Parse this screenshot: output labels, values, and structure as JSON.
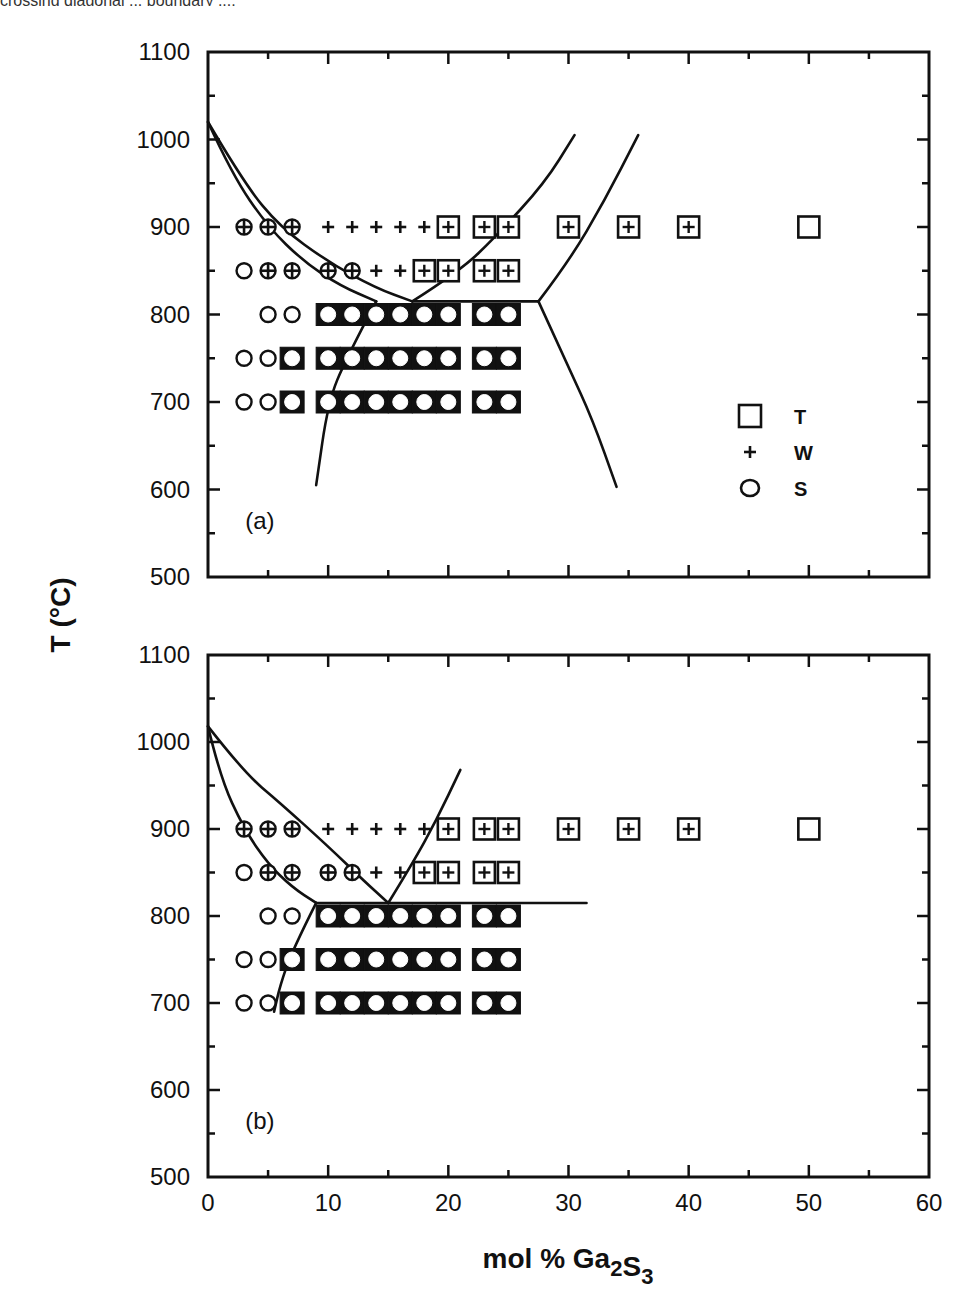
{
  "figure": {
    "top_caption_fragment": "crossing diagonal ... boundary ...;"
  },
  "chart_data": [
    {
      "type": "scatter",
      "panel_label": "(a)",
      "title": "",
      "xlabel": "mol % Ga2S3",
      "ylabel": "T (°C)",
      "xlim": [
        0,
        60
      ],
      "ylim": [
        500,
        1100
      ],
      "xticks": [
        0,
        10,
        20,
        30,
        40,
        50,
        60
      ],
      "yticks": [
        500,
        600,
        700,
        800,
        900,
        1000,
        1100
      ],
      "grid": false,
      "legend": {
        "position": "lower right",
        "entries": [
          {
            "marker": "square",
            "label": "T"
          },
          {
            "marker": "plus",
            "label": "W"
          },
          {
            "marker": "circle",
            "label": "S"
          }
        ]
      },
      "points": [
        {
          "x": 3,
          "y": 900,
          "phases": [
            "W",
            "S"
          ]
        },
        {
          "x": 5,
          "y": 900,
          "phases": [
            "W",
            "S"
          ]
        },
        {
          "x": 7,
          "y": 900,
          "phases": [
            "W",
            "S"
          ]
        },
        {
          "x": 10,
          "y": 900,
          "phases": [
            "W"
          ]
        },
        {
          "x": 12,
          "y": 900,
          "phases": [
            "W"
          ]
        },
        {
          "x": 14,
          "y": 900,
          "phases": [
            "W"
          ]
        },
        {
          "x": 16,
          "y": 900,
          "phases": [
            "W"
          ]
        },
        {
          "x": 18,
          "y": 900,
          "phases": [
            "W"
          ]
        },
        {
          "x": 20,
          "y": 900,
          "phases": [
            "T",
            "W"
          ]
        },
        {
          "x": 23,
          "y": 900,
          "phases": [
            "T",
            "W"
          ]
        },
        {
          "x": 25,
          "y": 900,
          "phases": [
            "T",
            "W"
          ]
        },
        {
          "x": 30,
          "y": 900,
          "phases": [
            "T",
            "W"
          ]
        },
        {
          "x": 35,
          "y": 900,
          "phases": [
            "T",
            "W"
          ]
        },
        {
          "x": 40,
          "y": 900,
          "phases": [
            "T",
            "W"
          ]
        },
        {
          "x": 50,
          "y": 900,
          "phases": [
            "T"
          ]
        },
        {
          "x": 3,
          "y": 850,
          "phases": [
            "S"
          ]
        },
        {
          "x": 5,
          "y": 850,
          "phases": [
            "W",
            "S"
          ]
        },
        {
          "x": 7,
          "y": 850,
          "phases": [
            "W",
            "S"
          ]
        },
        {
          "x": 10,
          "y": 850,
          "phases": [
            "W",
            "S"
          ]
        },
        {
          "x": 12,
          "y": 850,
          "phases": [
            "W",
            "S"
          ]
        },
        {
          "x": 14,
          "y": 850,
          "phases": [
            "W"
          ]
        },
        {
          "x": 16,
          "y": 850,
          "phases": [
            "W"
          ]
        },
        {
          "x": 18,
          "y": 850,
          "phases": [
            "T",
            "W"
          ]
        },
        {
          "x": 20,
          "y": 850,
          "phases": [
            "T",
            "W"
          ]
        },
        {
          "x": 23,
          "y": 850,
          "phases": [
            "T",
            "W"
          ]
        },
        {
          "x": 25,
          "y": 850,
          "phases": [
            "T",
            "W"
          ]
        },
        {
          "x": 5,
          "y": 800,
          "phases": [
            "S"
          ]
        },
        {
          "x": 7,
          "y": 800,
          "phases": [
            "S"
          ]
        },
        {
          "x": 10,
          "y": 800,
          "phases": [
            "T",
            "S"
          ]
        },
        {
          "x": 12,
          "y": 800,
          "phases": [
            "T",
            "S"
          ]
        },
        {
          "x": 14,
          "y": 800,
          "phases": [
            "T",
            "S"
          ]
        },
        {
          "x": 16,
          "y": 800,
          "phases": [
            "T",
            "S"
          ]
        },
        {
          "x": 18,
          "y": 800,
          "phases": [
            "T",
            "S"
          ]
        },
        {
          "x": 20,
          "y": 800,
          "phases": [
            "T",
            "S"
          ]
        },
        {
          "x": 23,
          "y": 800,
          "phases": [
            "T",
            "S"
          ]
        },
        {
          "x": 25,
          "y": 800,
          "phases": [
            "T",
            "S"
          ]
        },
        {
          "x": 3,
          "y": 750,
          "phases": [
            "S"
          ]
        },
        {
          "x": 5,
          "y": 750,
          "phases": [
            "S"
          ]
        },
        {
          "x": 7,
          "y": 750,
          "phases": [
            "T",
            "S"
          ]
        },
        {
          "x": 10,
          "y": 750,
          "phases": [
            "T",
            "S"
          ]
        },
        {
          "x": 12,
          "y": 750,
          "phases": [
            "T",
            "S"
          ]
        },
        {
          "x": 14,
          "y": 750,
          "phases": [
            "T",
            "S"
          ]
        },
        {
          "x": 16,
          "y": 750,
          "phases": [
            "T",
            "S"
          ]
        },
        {
          "x": 18,
          "y": 750,
          "phases": [
            "T",
            "S"
          ]
        },
        {
          "x": 20,
          "y": 750,
          "phases": [
            "T",
            "S"
          ]
        },
        {
          "x": 23,
          "y": 750,
          "phases": [
            "T",
            "S"
          ]
        },
        {
          "x": 25,
          "y": 750,
          "phases": [
            "T",
            "S"
          ]
        },
        {
          "x": 3,
          "y": 700,
          "phases": [
            "S"
          ]
        },
        {
          "x": 5,
          "y": 700,
          "phases": [
            "S"
          ]
        },
        {
          "x": 7,
          "y": 700,
          "phases": [
            "T",
            "S"
          ]
        },
        {
          "x": 10,
          "y": 700,
          "phases": [
            "T",
            "S"
          ]
        },
        {
          "x": 12,
          "y": 700,
          "phases": [
            "T",
            "S"
          ]
        },
        {
          "x": 14,
          "y": 700,
          "phases": [
            "T",
            "S"
          ]
        },
        {
          "x": 16,
          "y": 700,
          "phases": [
            "T",
            "S"
          ]
        },
        {
          "x": 18,
          "y": 700,
          "phases": [
            "T",
            "S"
          ]
        },
        {
          "x": 20,
          "y": 700,
          "phases": [
            "T",
            "S"
          ]
        },
        {
          "x": 23,
          "y": 700,
          "phases": [
            "T",
            "S"
          ]
        },
        {
          "x": 25,
          "y": 700,
          "phases": [
            "T",
            "S"
          ]
        }
      ],
      "phase_boundaries": [
        {
          "name": "liquidus-upper",
          "points": [
            [
              0,
              1020
            ],
            [
              3,
              950
            ],
            [
              6,
              900
            ],
            [
              10,
              860
            ],
            [
              14,
              830
            ],
            [
              17,
              815
            ]
          ]
        },
        {
          "name": "liquidus-lower",
          "points": [
            [
              0,
              1020
            ],
            [
              2,
              960
            ],
            [
              5,
              900
            ],
            [
              8,
              860
            ],
            [
              11,
              833
            ],
            [
              14,
              815
            ]
          ]
        },
        {
          "name": "solidus-left",
          "points": [
            [
              14,
              815
            ],
            [
              11.5,
              750
            ],
            [
              10,
              700
            ],
            [
              9,
              605
            ]
          ]
        },
        {
          "name": "eutectic-line",
          "points": [
            [
              17,
              815
            ],
            [
              27.5,
              815
            ]
          ]
        },
        {
          "name": "boundary-mid",
          "points": [
            [
              17,
              815
            ],
            [
              21,
              850
            ],
            [
              24,
              890
            ],
            [
              28,
              950
            ],
            [
              30.5,
              1005
            ]
          ]
        },
        {
          "name": "boundary-right-upper",
          "points": [
            [
              27.5,
              815
            ],
            [
              30,
              860
            ],
            [
              33,
              930
            ],
            [
              35.8,
              1005
            ]
          ]
        },
        {
          "name": "boundary-right-lower",
          "points": [
            [
              27.5,
              815
            ],
            [
              30,
              740
            ],
            [
              32,
              680
            ],
            [
              34,
              603
            ]
          ]
        }
      ]
    },
    {
      "type": "scatter",
      "panel_label": "(b)",
      "title": "",
      "xlabel": "mol % Ga2S3",
      "ylabel": "T (°C)",
      "xlim": [
        0,
        60
      ],
      "ylim": [
        500,
        1100
      ],
      "xticks": [
        0,
        10,
        20,
        30,
        40,
        50,
        60
      ],
      "yticks": [
        500,
        600,
        700,
        800,
        900,
        1000,
        1100
      ],
      "grid": false,
      "points": "same as panel (a)",
      "phase_boundaries": [
        {
          "name": "liquidus-upper",
          "points": [
            [
              0,
              1018
            ],
            [
              3,
              965
            ],
            [
              6,
              930
            ],
            [
              10,
              880
            ],
            [
              13,
              840
            ],
            [
              15,
              815
            ]
          ]
        },
        {
          "name": "liquidus-lower",
          "points": [
            [
              0,
              1018
            ],
            [
              1,
              960
            ],
            [
              3,
              900
            ],
            [
              5,
              860
            ],
            [
              7,
              833
            ],
            [
              9,
              815
            ]
          ]
        },
        {
          "name": "solidus-left",
          "points": [
            [
              9,
              815
            ],
            [
              7,
              760
            ],
            [
              6,
              720
            ],
            [
              5.5,
              690
            ]
          ]
        },
        {
          "name": "eutectic-line",
          "points": [
            [
              9,
              815
            ],
            [
              31.5,
              815
            ]
          ]
        },
        {
          "name": "boundary-mid",
          "points": [
            [
              15,
              815
            ],
            [
              17,
              860
            ],
            [
              19,
              910
            ],
            [
              21,
              968
            ]
          ]
        }
      ]
    }
  ],
  "layout": {
    "x_px": {
      "x0": 208,
      "x60": 929
    },
    "panel_a": {
      "top": 52,
      "bottom": 577
    },
    "panel_b": {
      "top": 655,
      "bottom": 1177
    }
  }
}
